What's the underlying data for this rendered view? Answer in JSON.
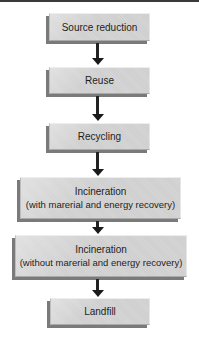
{
  "diagram": {
    "type": "flowchart",
    "direction": "top-to-bottom",
    "title": "",
    "nodes": [
      {
        "id": "source-reduction",
        "lines": [
          "Source reduction"
        ]
      },
      {
        "id": "reuse",
        "lines": [
          "Reuse"
        ]
      },
      {
        "id": "recycling",
        "lines": [
          "Recycling"
        ]
      },
      {
        "id": "incineration-with-recovery",
        "lines": [
          "Incineration",
          "(with marerial and energy recovery)"
        ]
      },
      {
        "id": "incineration-without-recovery",
        "lines": [
          "Incineration",
          "(without marerial and energy recovery)"
        ]
      },
      {
        "id": "landfill",
        "lines": [
          "Landfill"
        ]
      }
    ],
    "edges": [
      {
        "from": "source-reduction",
        "to": "reuse"
      },
      {
        "from": "reuse",
        "to": "recycling"
      },
      {
        "from": "recycling",
        "to": "incineration-with-recovery"
      },
      {
        "from": "incineration-with-recovery",
        "to": "incineration-without-recovery"
      },
      {
        "from": "incineration-without-recovery",
        "to": "landfill"
      }
    ]
  },
  "colors": {
    "box_fill": "#d4d4d4",
    "box_shadow": "#7a7a7a",
    "arrow": "#1a1a1a",
    "text": "#1e1e1e",
    "background": "#ffffff"
  }
}
